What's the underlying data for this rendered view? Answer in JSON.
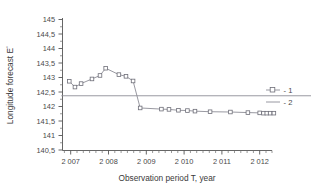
{
  "chart_data": {
    "type": "line",
    "title": "",
    "xlabel": "Observation period T, year",
    "ylabel": "Longitude forecast E°",
    "xlim": [
      2006.75,
      2012.35
    ],
    "ylim": [
      140.5,
      145.0
    ],
    "grid": false,
    "legend_position": "right",
    "xticks": [
      2007,
      2008,
      2009,
      2010,
      2011,
      2012
    ],
    "xtick_labels": [
      "2 007",
      "2 008",
      "2 009",
      "2 010",
      "2 011",
      "2 012"
    ],
    "yticks": [
      140.5,
      141.0,
      141.5,
      142.0,
      142.5,
      143.0,
      143.5,
      144.0,
      144.5,
      145.0
    ],
    "ytick_labels": [
      "140,5",
      "141",
      "141,5",
      "142",
      "142,5",
      "143",
      "143,5",
      "144",
      "144,5",
      "145"
    ],
    "series": [
      {
        "name": "1",
        "legend_label": "- 1",
        "marker": "square-open",
        "color": "#8d8d96",
        "x": [
          2006.97,
          2007.09,
          2007.22,
          2007.45,
          2007.62,
          2007.74,
          2008.02,
          2008.17,
          2008.32,
          2008.47,
          2008.92,
          2009.08,
          2009.28,
          2009.47,
          2009.63,
          2009.95,
          2010.38,
          2010.75,
          2011.0,
          2011.08,
          2011.15,
          2011.22,
          2011.3
        ],
        "y": [
          142.87,
          142.67,
          142.79,
          142.95,
          143.07,
          143.32,
          143.1,
          143.04,
          142.88,
          141.95,
          141.91,
          141.9,
          141.87,
          141.86,
          141.84,
          141.82,
          141.81,
          141.79,
          141.78,
          141.77,
          141.77,
          141.77,
          141.77
        ]
      },
      {
        "name": "2",
        "legend_label": "- 2",
        "marker": "none",
        "color": "#8d8d96",
        "constant_y": 142.37,
        "x": [
          2006.8,
          2012.45
        ],
        "y": [
          142.37,
          142.37
        ]
      }
    ]
  },
  "legend": {
    "entries": [
      {
        "label": "- 1",
        "marker": "square-open-with-line"
      },
      {
        "label": "- 2",
        "marker": "line"
      }
    ]
  },
  "axes": {
    "x_title": "Observation period T, year",
    "y_title_text": "Longitude forecast E",
    "y_title_superscript": "°"
  }
}
